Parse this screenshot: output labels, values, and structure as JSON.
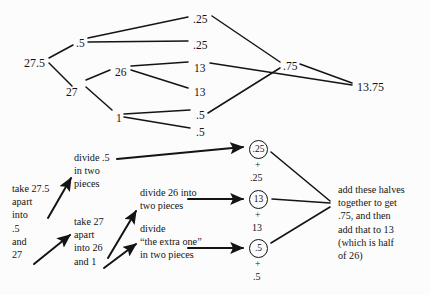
{
  "diagram": {
    "background_color": "#fcfcfc",
    "ink_color": "#141414",
    "tree": {
      "root": {
        "label": "27.5",
        "x": 24,
        "y": 57
      },
      "level1": [
        {
          "label": ".5",
          "x": 76,
          "y": 38
        },
        {
          "label": "27",
          "x": 66,
          "y": 87
        }
      ],
      "level2": [
        {
          "label": "26",
          "x": 115,
          "y": 67
        },
        {
          "label": "1",
          "x": 116,
          "y": 113
        }
      ],
      "leaves": [
        {
          "label": ".25",
          "x": 193,
          "y": 14
        },
        {
          "label": ".25",
          "x": 193,
          "y": 40
        },
        {
          "label": "13",
          "x": 194,
          "y": 63
        },
        {
          "label": "13",
          "x": 194,
          "y": 87
        },
        {
          "label": ".5",
          "x": 196,
          "y": 110
        },
        {
          "label": ".5",
          "x": 196,
          "y": 127
        }
      ],
      "merge": {
        "label": ".75",
        "x": 283,
        "y": 61
      },
      "total": {
        "label": "13.75",
        "x": 357,
        "y": 81
      }
    },
    "circles": [
      {
        "value": ".25",
        "plus": "+",
        "under": ".25",
        "cx": 258,
        "cy": 149
      },
      {
        "value": "13",
        "plus": "+",
        "under": "13",
        "cx": 258,
        "cy": 199
      },
      {
        "value": ".5",
        "plus": "+",
        "under": ".5",
        "cx": 258,
        "cy": 248
      }
    ],
    "annotations": [
      {
        "name": "take-27-5-apart",
        "text": "take 27.5\napart\ninto\n.5\nand\n27",
        "x": 12,
        "y": 182
      },
      {
        "name": "divide-point-5",
        "text": "divide .5\nin two\npieces",
        "x": 74,
        "y": 151
      },
      {
        "name": "take-27-apart",
        "text": "take 27\napart\ninto 26\nand 1",
        "x": 74,
        "y": 215
      },
      {
        "name": "divide-26",
        "text": "divide 26 into\ntwo pieces",
        "x": 140,
        "y": 186
      },
      {
        "name": "divide-extra-one",
        "text": "divide\n“the extra one”\nin two pieces",
        "x": 140,
        "y": 222
      },
      {
        "name": "add-halves-conclusion",
        "text": "add these halves\ntogether to get\n.75, and then\nadd that to 13\n(which is half\nof 26)",
        "x": 338,
        "y": 183
      }
    ]
  }
}
